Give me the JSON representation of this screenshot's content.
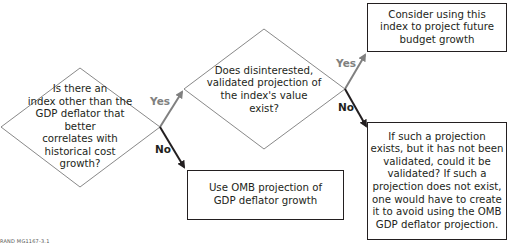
{
  "diagram": {
    "type": "flowchart",
    "nodes": {
      "q1": {
        "shape": "diamond",
        "text": "Is there an index other than the GDP deflator that better correlates with historical cost growth?",
        "lines": [
          "Is there an",
          "index other than the",
          "GDP deflator that better",
          "correlates with",
          "historical cost",
          "growth?"
        ]
      },
      "q2": {
        "shape": "diamond",
        "text": "Does disinterested, validated projection of the index's value exist?",
        "lines": [
          "Does disinterested,",
          "validated projection of",
          "the index's value",
          "exist?"
        ]
      },
      "use_omb": {
        "shape": "box",
        "lines": [
          "Use OMB projection of",
          "GDP deflator growth"
        ]
      },
      "consider_index": {
        "shape": "box",
        "lines": [
          "Consider using this",
          "index to project future",
          "budget growth"
        ]
      },
      "create_projection": {
        "shape": "box",
        "lines": [
          "If such a projection",
          "exists, but it has not been",
          "validated, could it be",
          "validated? If such a",
          "projection does not exist,",
          "one would have to create",
          "it to avoid using the OMB",
          "GDP deflator projection."
        ]
      }
    },
    "edges": [
      {
        "from": "q1",
        "to": "q2",
        "label": "Yes",
        "color": "#808080"
      },
      {
        "from": "q1",
        "to": "use_omb",
        "label": "No",
        "color": "#231f20"
      },
      {
        "from": "q2",
        "to": "consider_index",
        "label": "Yes",
        "color": "#808080"
      },
      {
        "from": "q2",
        "to": "create_projection",
        "label": "No",
        "color": "#231f20"
      }
    ],
    "footer": "RAND MG1167-3.1"
  },
  "colors": {
    "yes_arrow": "#808080",
    "no_arrow": "#231f20",
    "outline": "#231f20"
  }
}
